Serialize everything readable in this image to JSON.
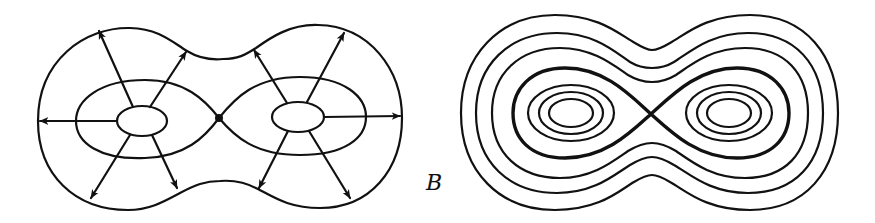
{
  "figure": {
    "panel_label": "B",
    "left_panel": {
      "description": "Gradient flow on a double-lobed surface: two minima (small ellipses), a saddle point between them, arrows radiating outward to boundary",
      "saddle_point": [
        219,
        118
      ],
      "minima_centers": [
        [
          142,
          121
        ],
        [
          298,
          117
        ]
      ],
      "arrow_count": 10
    },
    "right_panel": {
      "description": "Level curves of a double-well function: nested ovals around two centers, a figure-eight separatrix (bold), and outer peanut-shaped contours",
      "crossing_point": [
        651,
        114
      ],
      "centers": [
        [
          571,
          113
        ],
        [
          729,
          113
        ]
      ],
      "inner_ellipses_per_center": 3,
      "outer_contours": 3,
      "separatrix_style": "bold"
    },
    "colors": {
      "ink": "#111111",
      "background": "#ffffff"
    }
  }
}
